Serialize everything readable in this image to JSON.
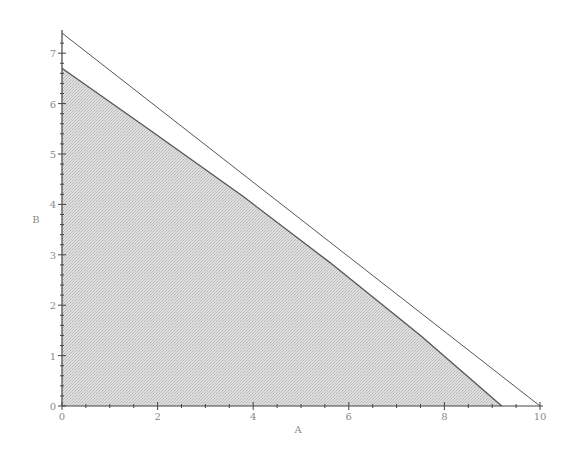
{
  "chart_data": {
    "type": "area",
    "title": "",
    "xlabel": "A",
    "ylabel": "B",
    "xlim": [
      0,
      10
    ],
    "ylim": [
      0,
      7.4
    ],
    "grid": false,
    "legend": null,
    "x_ticks": [
      "0",
      "2",
      "4",
      "6",
      "8",
      "10"
    ],
    "y_ticks": [
      "0",
      "1",
      "2",
      "3",
      "4",
      "5",
      "6",
      "7"
    ],
    "series": [
      {
        "name": "feasible-region",
        "kind": "shaded-polygon",
        "points": [
          [
            0,
            6.7
          ],
          [
            1.8,
            5.5
          ],
          [
            3.8,
            4.15
          ],
          [
            5.6,
            2.85
          ],
          [
            7.5,
            1.4
          ],
          [
            9.2,
            0
          ],
          [
            0,
            0
          ]
        ]
      },
      {
        "name": "constraint-line",
        "kind": "line",
        "points": [
          [
            0,
            7.4
          ],
          [
            10,
            0
          ]
        ]
      }
    ]
  },
  "colors": {
    "fill": "#d4d4d4",
    "line": "#555555",
    "axis": "#444444",
    "text": "#8a8a8a"
  }
}
